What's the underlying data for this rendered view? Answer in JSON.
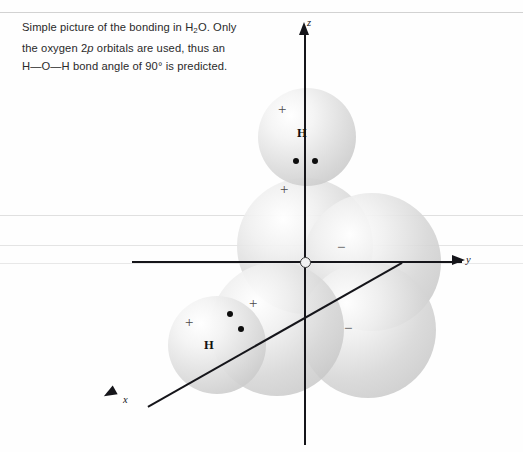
{
  "caption": {
    "line1_a": "Simple picture of the bonding in H",
    "line1_sub": "2",
    "line1_b": "O. Only",
    "line2_a": "the oxygen 2",
    "line2_ital": "p",
    "line2_b": " orbitals are used, thus an",
    "line3": "H—O—H bond angle of 90° is predicted."
  },
  "diagram": {
    "type": "orbital-bonding-diagram",
    "molecule": "H2O",
    "axes": [
      {
        "name": "z-axis",
        "label": "z",
        "direction": "up"
      },
      {
        "name": "y-axis",
        "label": "y",
        "direction": "right"
      },
      {
        "name": "x-axis",
        "label": "x",
        "direction": "down-left"
      }
    ],
    "origin_label": "O",
    "spheres": [
      {
        "name": "hydrogen-top",
        "kind": "hydrogen",
        "sign": "+",
        "atom": "H",
        "electrons": 2
      },
      {
        "name": "oxygen-2p-z-upper",
        "kind": "lobe",
        "sign": "+"
      },
      {
        "name": "oxygen-2p-y-positive",
        "kind": "lobe",
        "sign": "−"
      },
      {
        "name": "oxygen-2p-z-lower",
        "kind": "lobe",
        "sign": "−"
      },
      {
        "name": "oxygen-2p-x-upper",
        "kind": "lobe",
        "sign": "+"
      },
      {
        "name": "hydrogen-lower-left",
        "kind": "hydrogen",
        "sign": "+",
        "atom": "H",
        "electrons": 2
      }
    ],
    "signs": {
      "plus": "+",
      "minus": "−",
      "hydrogen": "H"
    }
  }
}
